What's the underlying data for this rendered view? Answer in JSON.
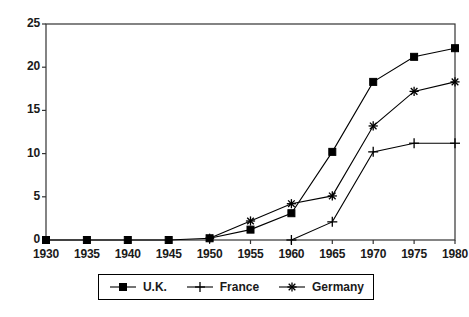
{
  "chart_data": {
    "type": "line",
    "title": "",
    "xlabel": "",
    "ylabel": "",
    "categories": [
      1930,
      1935,
      1940,
      1945,
      1950,
      1955,
      1960,
      1965,
      1970,
      1975,
      1980
    ],
    "xtick_labels": [
      "1930",
      "1935",
      "1940",
      "1945",
      "1950",
      "1955",
      "1960",
      "1965",
      "1970",
      "1975",
      "1980"
    ],
    "ytick_labels": [
      "0",
      "5",
      "10",
      "15",
      "20",
      "25"
    ],
    "yticks": [
      0,
      5,
      10,
      15,
      20,
      25
    ],
    "ylim": [
      0,
      25
    ],
    "xlim": [
      1930,
      1980
    ],
    "grid": false,
    "legend_position": "bottom",
    "series": [
      {
        "name": "U.K.",
        "marker": "filled-square",
        "color": "#000000",
        "values": [
          0,
          0,
          0,
          0,
          0.2,
          1.2,
          3.1,
          10.2,
          18.3,
          21.2,
          22.2
        ]
      },
      {
        "name": "France",
        "marker": "plus",
        "color": "#000000",
        "values": [
          null,
          null,
          null,
          null,
          null,
          null,
          0.0,
          2.1,
          10.2,
          11.2,
          11.2
        ]
      },
      {
        "name": "Germany",
        "marker": "asterisk",
        "color": "#000000",
        "values": [
          null,
          null,
          null,
          null,
          0.2,
          2.2,
          4.2,
          5.1,
          13.2,
          17.2,
          18.3
        ]
      }
    ]
  },
  "legend": {
    "items": [
      {
        "label": "U.K.",
        "marker": "filled-square"
      },
      {
        "label": "France",
        "marker": "plus"
      },
      {
        "label": "Germany",
        "marker": "asterisk"
      }
    ]
  }
}
